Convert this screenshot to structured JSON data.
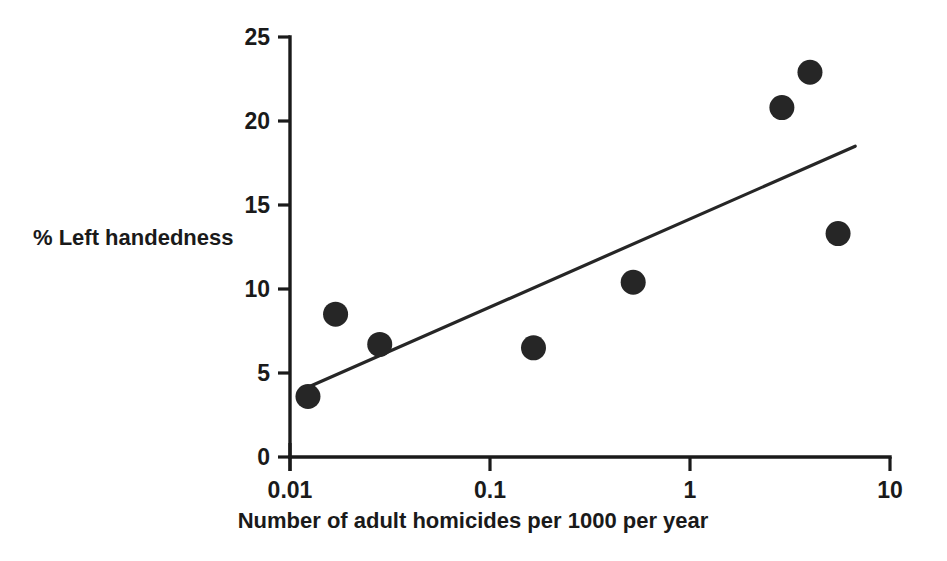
{
  "chart_data": {
    "type": "scatter",
    "title": "",
    "xlabel": "Number of adult homicides per 1000 per year",
    "ylabel": "% Left handedness",
    "xscale": "log",
    "yscale": "linear",
    "xlim": [
      0.01,
      10
    ],
    "ylim": [
      0,
      25
    ],
    "xticks": [
      "0.01",
      "0.1",
      "1",
      "10"
    ],
    "xtick_values": [
      0.01,
      0.1,
      1,
      10
    ],
    "yticks": [
      "0",
      "5",
      "10",
      "15",
      "20",
      "25"
    ],
    "ytick_values": [
      0,
      5,
      10,
      15,
      20,
      25
    ],
    "grid": false,
    "legend": false,
    "legend_position": "none",
    "marker": "filled-circle",
    "marker_color": "#262626",
    "points": [
      {
        "x": 0.0123,
        "y": 3.6
      },
      {
        "x": 0.0169,
        "y": 8.5
      },
      {
        "x": 0.0281,
        "y": 6.7
      },
      {
        "x": 0.165,
        "y": 6.5
      },
      {
        "x": 0.52,
        "y": 10.4
      },
      {
        "x": 2.88,
        "y": 20.8
      },
      {
        "x": 3.98,
        "y": 22.9
      },
      {
        "x": 5.5,
        "y": 13.3
      }
    ],
    "trendline": {
      "type": "linear-fit-on-log-x",
      "color": "#262626",
      "start": {
        "x": 0.0115,
        "y": 4.0
      },
      "end": {
        "x": 6.7,
        "y": 18.5
      }
    }
  },
  "colors": {
    "axis": "#1a1a1a",
    "marker": "#262626",
    "background": "#ffffff"
  }
}
